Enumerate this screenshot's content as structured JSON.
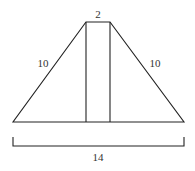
{
  "diagram": {
    "type": "trapezoid-dimension-figure",
    "labels": {
      "top_width": "2",
      "left_side": "10",
      "right_side": "10",
      "base_width": "14"
    },
    "colors": {
      "stroke": "#222222",
      "text": "#333333",
      "background": "#ffffff"
    }
  }
}
